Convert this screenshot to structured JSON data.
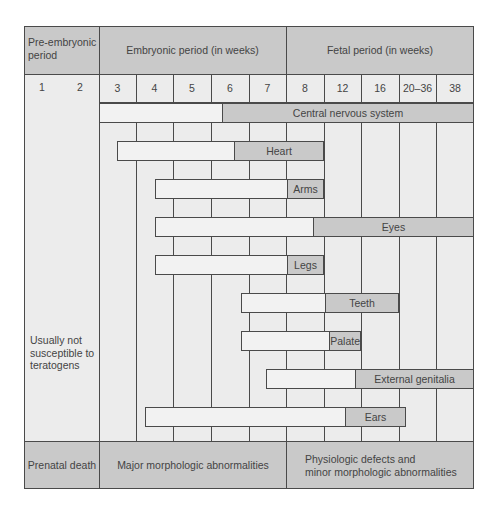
{
  "header": {
    "pre_embryonic": "Pre-embryonic\nperiod",
    "embryonic": "Embryonic period (in weeks)",
    "fetal": "Fetal period (in weeks)"
  },
  "weeks": {
    "pre": [
      "1",
      "2"
    ],
    "columns": [
      "3",
      "4",
      "5",
      "6",
      "7",
      "8",
      "12",
      "16",
      "20–36",
      "38"
    ]
  },
  "side_label": "Usually not\nsusceptible to\nteratogens",
  "footer": {
    "prenatal_death": "Prenatal death",
    "major": "Major morphologic abnormalities",
    "minor": "Physiologic defects and\nminor morphologic abnormalities"
  },
  "bars": [
    {
      "label": "Central nervous system",
      "x0": 99,
      "xd": 221,
      "x1": 474,
      "y": 103
    },
    {
      "label": "Heart",
      "x0": 117,
      "xd": 233,
      "x1": 324,
      "y": 141
    },
    {
      "label": "Arms",
      "x0": 155,
      "xd": 286,
      "x1": 324,
      "y": 179
    },
    {
      "label": "Eyes",
      "x0": 155,
      "xd": 312,
      "x1": 474,
      "y": 217
    },
    {
      "label": "Legs",
      "x0": 155,
      "xd": 286,
      "x1": 324,
      "y": 255
    },
    {
      "label": "Teeth",
      "x0": 241,
      "xd": 324,
      "x1": 399,
      "y": 293
    },
    {
      "label": "Palate",
      "x0": 241,
      "xd": 330,
      "x1": 361,
      "y": 331
    },
    {
      "label": "External genitalia",
      "x0": 266,
      "xd": 354,
      "x1": 474,
      "y": 369
    },
    {
      "label": "Ears",
      "x0": 145,
      "xd": 344,
      "x1": 406,
      "y": 407
    }
  ],
  "colors": {
    "dark_fill": "#c9c9c9",
    "light_fill": "#ececec",
    "bar_light": "#f2f2f2",
    "line": "#4a4a4a"
  }
}
